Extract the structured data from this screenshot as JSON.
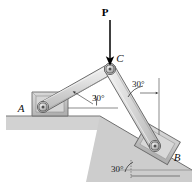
{
  "figure": {
    "width": 193,
    "height": 193,
    "background_color": "#ffffff"
  },
  "labels": {
    "force": "P",
    "joint_a": "A",
    "joint_b": "B",
    "joint_c": "C",
    "angle_ac": "30°",
    "angle_cb": "30°",
    "angle_incline": "30°"
  },
  "colors": {
    "member_fill": "#d9d9d9",
    "member_fill_light": "#ececec",
    "member_stroke": "#5a5a5a",
    "ground_fill": "#d0d0d0",
    "ground_stroke": "#8a8a8a",
    "incline_fill": "#cfcfcf",
    "block_fill": "#c9c9c9",
    "block_stroke": "#6b6b6b",
    "pin_outer": "#b5b5b5",
    "pin_inner": "#4a4a4a",
    "arrow": "#000000",
    "leader": "#3c3c3c",
    "text": "#111111"
  },
  "geometry": {
    "pin_a": {
      "x": 43,
      "y": 107
    },
    "pin_c": {
      "x": 110,
      "y": 69
    },
    "pin_b": {
      "x": 155,
      "y": 146
    },
    "force_arrow": {
      "x": 110,
      "y_start": 18,
      "y_end": 64
    },
    "incline_angle_deg": 30,
    "member_ac_angle_deg": 30,
    "member_cb_from_vertical_deg": 30
  },
  "annotations": {
    "horizontal_reference": "horizontal datum line at joint A level",
    "vertical_reference": "vertical datum line at joint B side",
    "incline_reference": "horizontal datum at base of incline"
  }
}
